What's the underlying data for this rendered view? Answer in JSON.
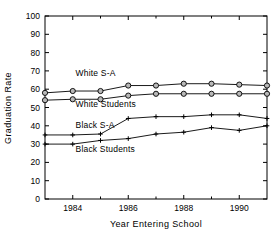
{
  "chart_data": {
    "type": "line",
    "title": "",
    "xlabel": "Year Entering School",
    "ylabel": "Graduation Rate",
    "xlim": [
      1983,
      1991
    ],
    "ylim": [
      0,
      100
    ],
    "grid": false,
    "legend_position": "inline-annotations",
    "x": [
      1983,
      1984,
      1985,
      1986,
      1987,
      1988,
      1989,
      1990,
      1991
    ],
    "xticks": [
      1984,
      1986,
      1988,
      1990
    ],
    "xtick_labels": [
      "1984",
      "1986",
      "1988",
      "1990"
    ],
    "xminor_ticks": [
      1983,
      1985,
      1987,
      1989,
      1991
    ],
    "yticks": [
      0,
      10,
      20,
      30,
      40,
      50,
      60,
      70,
      80,
      90,
      100
    ],
    "ytick_labels": [
      "0",
      "10",
      "20",
      "30",
      "40",
      "50",
      "60",
      "70",
      "80",
      "90",
      "100"
    ],
    "series": [
      {
        "name": "White S-A",
        "marker": "circle",
        "values": [
          58,
          59,
          59,
          62,
          62,
          63,
          63,
          62.5,
          62
        ],
        "label_x": 1984.1,
        "label_y": 67
      },
      {
        "name": "White Students",
        "marker": "circle",
        "values": [
          54,
          54.5,
          54.5,
          56.5,
          57.5,
          57.5,
          57.5,
          57.5,
          57.5
        ],
        "label_x": 1984.1,
        "label_y": 50.5
      },
      {
        "name": "Black S-A",
        "marker": "plus",
        "values": [
          35,
          35,
          35.5,
          44,
          45,
          45,
          46,
          46,
          44
        ],
        "label_x": 1984.1,
        "label_y": 39
      },
      {
        "name": "Black Students",
        "marker": "plus",
        "values": [
          30,
          30,
          32,
          33,
          35.5,
          36.5,
          39,
          37.5,
          40
        ],
        "label_x": 1984.1,
        "label_y": 25.5
      }
    ],
    "colors": {
      "axis": "#000000",
      "line": "#000000",
      "marker_fill": "#b8b8b8"
    }
  }
}
